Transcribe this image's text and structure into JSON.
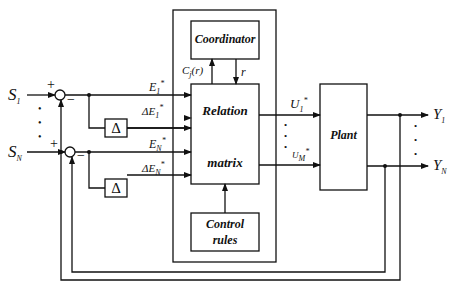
{
  "inputs": {
    "s1": {
      "base": "S",
      "sub": "1"
    },
    "sn": {
      "base": "S",
      "sub": "N"
    }
  },
  "signs": {
    "plus": "+",
    "minus": "−"
  },
  "signals": {
    "e1": {
      "base": "E",
      "sub": "1",
      "sup": "*"
    },
    "de1": {
      "base": "ΔE",
      "sub": "1",
      "sup": "*"
    },
    "en": {
      "base": "E",
      "sub": "N",
      "sup": "*"
    },
    "den": {
      "base": "ΔE",
      "sub": "N",
      "sup": "*"
    },
    "u1": {
      "base": "U",
      "sub": "1",
      "sup": "*"
    },
    "um": {
      "base": "U",
      "sub": "M",
      "sup": "*"
    },
    "cj": {
      "base": "C",
      "sub": "j",
      "tail": "(r)"
    },
    "r": "r"
  },
  "blocks": {
    "delta": "Δ",
    "coordinator": "Coordinator",
    "relation_top": "Relation",
    "relation_bottom": "matrix",
    "control_rules_1": "Control",
    "control_rules_2": "rules",
    "plant": "Plant"
  },
  "outputs": {
    "y1": {
      "base": "Y",
      "sub": "1"
    },
    "yn": {
      "base": "Y",
      "sub": "N"
    }
  },
  "ellipsis": "•"
}
